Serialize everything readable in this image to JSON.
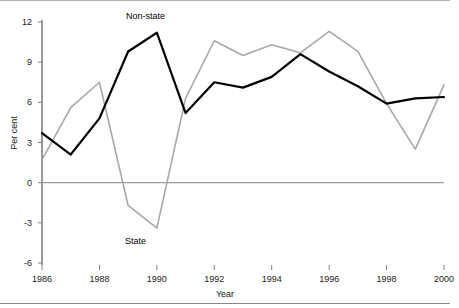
{
  "chart_data": {
    "type": "line",
    "title": "",
    "xlabel": "Year",
    "ylabel": "Per cent",
    "x": [
      1986,
      1987,
      1988,
      1989,
      1990,
      1991,
      1992,
      1993,
      1994,
      1995,
      1996,
      1997,
      1998,
      1999,
      2000
    ],
    "xlim": [
      1986,
      2000
    ],
    "ylim": [
      -6,
      12
    ],
    "yticks": [
      12,
      9,
      6,
      3,
      0,
      -3,
      -6
    ],
    "ytick_labels": [
      "12",
      "9",
      "6",
      "3",
      "0",
      "-3",
      "-6"
    ],
    "xticks": [
      1986,
      1988,
      1990,
      1992,
      1994,
      1996,
      1998,
      2000
    ],
    "xtick_labels": [
      "1986",
      "1988",
      "1990",
      "1992",
      "1994",
      "1996",
      "1998",
      "2000"
    ],
    "grid": false,
    "legend": "inline-annotations",
    "zero_line": true,
    "series": [
      {
        "name": "Non-state",
        "color": "#000000",
        "width": 2.2,
        "annotation": "Non-state",
        "values": [
          3.7,
          2.1,
          4.8,
          9.8,
          11.2,
          5.2,
          7.5,
          7.1,
          7.9,
          9.6,
          8.3,
          7.2,
          5.9,
          6.3,
          6.4
        ]
      },
      {
        "name": "State",
        "color": "#a8a8a8",
        "width": 1.6,
        "annotation": "State",
        "values": [
          1.7,
          5.6,
          7.5,
          -1.7,
          -3.4,
          6.3,
          10.6,
          9.5,
          10.3,
          9.7,
          11.3,
          9.8,
          5.9,
          2.5,
          7.3
        ]
      }
    ]
  },
  "axes": {
    "ylabel": "Per cent",
    "xlabel": "Year"
  },
  "annotations": {
    "nonstate": "Non-state",
    "state": "State"
  },
  "colors": {
    "nonstate_line": "#000000",
    "state_line": "#a8a8a8",
    "axis": "#808080",
    "frame": "#b4b4b4",
    "text": "#1a1a1a"
  }
}
